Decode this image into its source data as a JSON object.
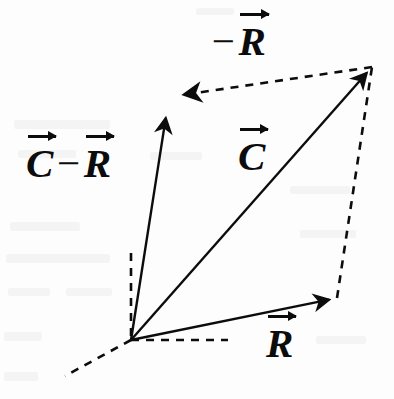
{
  "figure": {
    "kind": "vector-diagram",
    "width": 394,
    "height": 399,
    "background_color": "#fdfdfd",
    "ink_color": "#0c0c0c"
  },
  "chart_data": {
    "type": "diagram",
    "origin": {
      "x": 131,
      "y": 340
    },
    "vectors": [
      {
        "name": "C",
        "label": "C",
        "label_prefix": "",
        "style": "solid",
        "from": {
          "x": 131,
          "y": 340
        },
        "to": {
          "x": 372,
          "y": 67
        },
        "arrowhead": "end"
      },
      {
        "name": "R",
        "label": "R",
        "label_prefix": "",
        "style": "solid",
        "from": {
          "x": 131,
          "y": 340
        },
        "to": {
          "x": 337,
          "y": 298
        },
        "arrowhead": "end"
      },
      {
        "name": "C-minus-R",
        "label": "R",
        "label_prefix": "C",
        "style": "solid",
        "from": {
          "x": 131,
          "y": 340
        },
        "to": {
          "x": 167,
          "y": 110
        },
        "arrowhead": "end"
      },
      {
        "name": "negative-R",
        "label": "R",
        "label_prefix": "minus",
        "style": "dashed",
        "from": {
          "x": 372,
          "y": 67
        },
        "to": {
          "x": 175,
          "y": 96
        },
        "arrowhead": "end"
      }
    ],
    "construction_lines": [
      {
        "name": "closing-side-right",
        "style": "dashed",
        "from": {
          "x": 337,
          "y": 298
        },
        "to": {
          "x": 372,
          "y": 67
        }
      },
      {
        "name": "axis-vertical",
        "style": "dashed",
        "from": {
          "x": 131,
          "y": 253
        },
        "to": {
          "x": 131,
          "y": 340
        }
      },
      {
        "name": "axis-horizontal",
        "style": "dashed",
        "from": {
          "x": 131,
          "y": 340
        },
        "to": {
          "x": 228,
          "y": 340
        }
      },
      {
        "name": "axis-depth",
        "style": "dashed",
        "from": {
          "x": 131,
          "y": 340
        },
        "to": {
          "x": 65,
          "y": 376
        }
      }
    ],
    "legend": "none",
    "grid": false
  },
  "labels": {
    "neg_r": {
      "minus": "−",
      "symbol": "R"
    },
    "c_minus_r": {
      "first": "C",
      "minus": "−",
      "second": "R"
    },
    "c": {
      "symbol": "C"
    },
    "r": {
      "symbol": "R"
    }
  }
}
